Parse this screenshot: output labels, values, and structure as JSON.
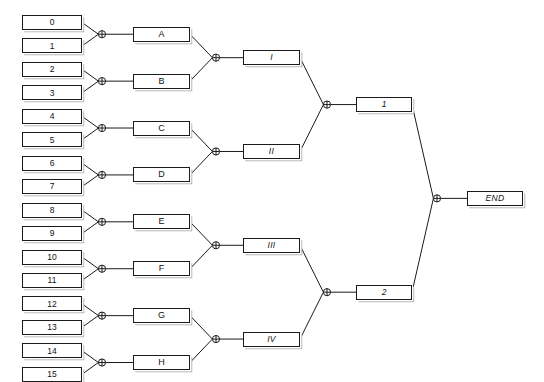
{
  "diagram": {
    "type": "bracket-tree",
    "background_color": "#ffffff",
    "line_color": "#1b1b1b",
    "box_fill": "#ffffff",
    "box_border": "#1b1b1b",
    "junction_icon": "circled-plus-icon"
  },
  "rounds": {
    "seeds": {
      "name": "seeds",
      "count": 16,
      "items": [
        {
          "label": "0"
        },
        {
          "label": "1"
        },
        {
          "label": "2"
        },
        {
          "label": "3"
        },
        {
          "label": "4"
        },
        {
          "label": "5"
        },
        {
          "label": "6"
        },
        {
          "label": "7"
        },
        {
          "label": "8"
        },
        {
          "label": "9"
        },
        {
          "label": "10"
        },
        {
          "label": "11"
        },
        {
          "label": "12"
        },
        {
          "label": "13"
        },
        {
          "label": "14"
        },
        {
          "label": "15"
        }
      ]
    },
    "round1": {
      "name": "round-1",
      "count": 8,
      "items": [
        {
          "label": "A"
        },
        {
          "label": "B"
        },
        {
          "label": "C"
        },
        {
          "label": "D"
        },
        {
          "label": "E"
        },
        {
          "label": "F"
        },
        {
          "label": "G"
        },
        {
          "label": "H"
        }
      ]
    },
    "round2": {
      "name": "round-2",
      "count": 4,
      "items": [
        {
          "label": "I"
        },
        {
          "label": "II"
        },
        {
          "label": "III"
        },
        {
          "label": "IV"
        }
      ]
    },
    "round3": {
      "name": "round-3",
      "count": 2,
      "items": [
        {
          "label": "1"
        },
        {
          "label": "2"
        }
      ]
    },
    "final": {
      "name": "final",
      "count": 1,
      "items": [
        {
          "label": "END"
        }
      ]
    }
  },
  "junctions": {
    "round1": [
      {
        "name": "merge-0-1"
      },
      {
        "name": "merge-2-3"
      },
      {
        "name": "merge-4-5"
      },
      {
        "name": "merge-6-7"
      },
      {
        "name": "merge-8-9"
      },
      {
        "name": "merge-10-11"
      },
      {
        "name": "merge-12-13"
      },
      {
        "name": "merge-14-15"
      }
    ],
    "round2": [
      {
        "name": "merge-A-B"
      },
      {
        "name": "merge-C-D"
      },
      {
        "name": "merge-E-F"
      },
      {
        "name": "merge-G-H"
      }
    ],
    "round3": [
      {
        "name": "merge-I-II"
      },
      {
        "name": "merge-III-IV"
      }
    ],
    "final": [
      {
        "name": "merge-1-2"
      }
    ]
  }
}
